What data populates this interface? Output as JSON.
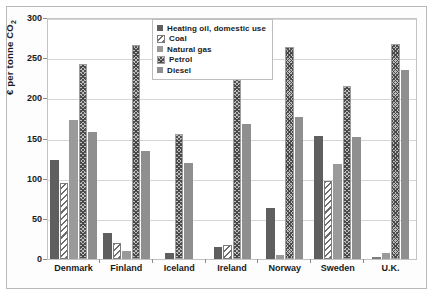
{
  "chart_data": {
    "type": "bar",
    "title": "",
    "xlabel": "",
    "ylabel": "€ per tonne CO₂",
    "ylim": [
      0,
      300
    ],
    "yticks": [
      0,
      50,
      100,
      150,
      200,
      250,
      300
    ],
    "grid": true,
    "legend_position": "top-center",
    "categories": [
      "Denmark",
      "Finland",
      "Iceland",
      "Ireland",
      "Norway",
      "Sweden",
      "U.K."
    ],
    "series": [
      {
        "name": "Heating oil, domestic use",
        "values": [
          123,
          33,
          8,
          15,
          64,
          153,
          0
        ]
      },
      {
        "name": "Coal",
        "values": [
          95,
          20,
          0,
          17,
          0,
          97,
          3
        ]
      },
      {
        "name": "Natural gas",
        "values": [
          173,
          10,
          0,
          0,
          5,
          118,
          7
        ]
      },
      {
        "name": "Petrol",
        "values": [
          243,
          267,
          156,
          232,
          264,
          215,
          268
        ]
      },
      {
        "name": "Diesel",
        "values": [
          158,
          135,
          120,
          168,
          177,
          152,
          235
        ]
      }
    ]
  },
  "legend": {
    "items": [
      {
        "label": "Heating oil, domestic use",
        "swatch": "legend-swatch-heating-oil"
      },
      {
        "label": "Coal",
        "swatch": "legend-swatch-coal"
      },
      {
        "label": "Natural gas",
        "swatch": "legend-swatch-natural-gas"
      },
      {
        "label": "Petrol",
        "swatch": "legend-swatch-petrol"
      },
      {
        "label": "Diesel",
        "swatch": "legend-swatch-diesel"
      }
    ]
  },
  "axis": {
    "y_label_text": "€ per tonne CO",
    "y_label_sub": "2"
  },
  "colors": {
    "heating_oil": "#5f5f5f",
    "coal": "#6e6e6e",
    "natural_gas": "#9a9a9a",
    "petrol": "#bdbdbd",
    "diesel": "#8f8f8f",
    "grid": "#d6d6d6",
    "axis": "#8c8c8c",
    "text": "#1a1a1a"
  }
}
